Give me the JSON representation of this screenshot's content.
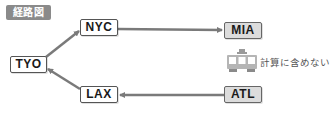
{
  "header": {
    "badge_label": "経路図"
  },
  "nodes": {
    "tyo": {
      "label": "TYO",
      "style": "origin"
    },
    "nyc": {
      "label": "NYC",
      "style": "origin"
    },
    "lax": {
      "label": "LAX",
      "style": "origin"
    },
    "mia": {
      "label": "MIA",
      "style": "destination"
    },
    "atl": {
      "label": "ATL",
      "style": "destination"
    }
  },
  "edges": [
    {
      "from": "TYO",
      "to": "NYC"
    },
    {
      "from": "NYC",
      "to": "MIA"
    },
    {
      "from": "LAX",
      "to": "TYO"
    },
    {
      "from": "ATL",
      "to": "LAX"
    }
  ],
  "legend": {
    "icon": "train-icon",
    "text": "計算に含めない"
  },
  "colors": {
    "badge_bg": "#8a8a8a",
    "edge": "#7a7a7a",
    "dest_bg": "#dcdcdc",
    "origin_bg": "#ffffff"
  }
}
